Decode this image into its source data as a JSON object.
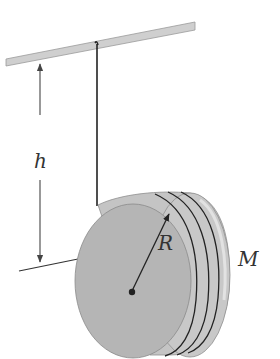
{
  "diagram": {
    "labels": {
      "height": "h",
      "radius": "R",
      "mass": "M"
    },
    "colors": {
      "ceiling_bar": "#c8c8c8",
      "disk_face": "#b3b3b3",
      "disk_rim": "#c4c4c4",
      "string": "#222222",
      "dimension_line": "#444444",
      "text": "#333333"
    },
    "components": [
      "ceiling-bar",
      "string",
      "height-dimension-arrow",
      "floor-reference-line",
      "disk",
      "string-windings",
      "radius-arrow",
      "center-point"
    ]
  }
}
